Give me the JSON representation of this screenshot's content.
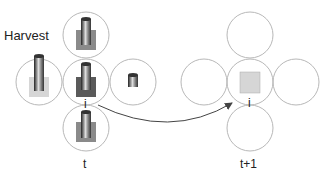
{
  "labels": {
    "harvest": "Harvest",
    "cell_left": "i",
    "cell_right": "i",
    "time_left": "t",
    "time_right": "t+1"
  },
  "colors": {
    "circle": "#b8b8b8",
    "dark_square": "#5a5a5a",
    "mid_square": "#8a8a8a",
    "light_square": "#d6d6d6",
    "arrow": "#444444"
  }
}
